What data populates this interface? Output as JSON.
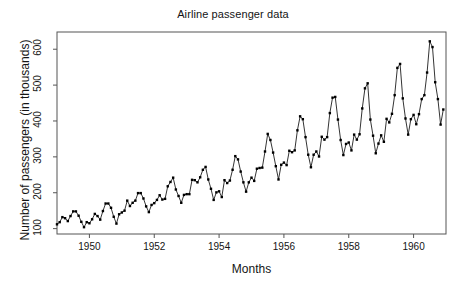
{
  "chart_data": {
    "type": "line",
    "title": "Airline passenger data",
    "xlabel": "Months",
    "ylabel": "Number of passengers (in thousands)",
    "xlim": [
      1949.0,
      1961.0
    ],
    "ylim": [
      85,
      648
    ],
    "grid": false,
    "legend": null,
    "marker": "filled-square",
    "line_color": "#000000",
    "marker_color": "#000000",
    "frame_color": "#555555",
    "background": "#ffffff",
    "xticks": [
      1950,
      1952,
      1954,
      1956,
      1958,
      1960
    ],
    "xtick_labels": [
      "1950",
      "1952",
      "1954",
      "1956",
      "1958",
      "1960"
    ],
    "yticks": [
      100,
      200,
      300,
      400,
      500,
      600
    ],
    "ytick_labels": [
      "100",
      "200",
      "300",
      "400",
      "500",
      "600"
    ],
    "x_start": 1949.0,
    "x_step": 0.0833333,
    "series": [
      {
        "name": "AirPassengers",
        "values": [
          112,
          118,
          132,
          129,
          121,
          135,
          148,
          148,
          136,
          119,
          104,
          118,
          115,
          126,
          141,
          135,
          125,
          149,
          170,
          170,
          158,
          133,
          114,
          140,
          145,
          150,
          178,
          163,
          172,
          178,
          199,
          199,
          184,
          162,
          146,
          166,
          171,
          180,
          193,
          181,
          183,
          218,
          230,
          242,
          209,
          191,
          172,
          194,
          196,
          196,
          236,
          235,
          229,
          243,
          264,
          272,
          237,
          211,
          180,
          201,
          204,
          188,
          235,
          227,
          234,
          264,
          302,
          293,
          259,
          229,
          203,
          229,
          242,
          233,
          267,
          269,
          270,
          315,
          364,
          347,
          312,
          274,
          237,
          278,
          284,
          277,
          317,
          313,
          318,
          374,
          413,
          405,
          355,
          306,
          271,
          306,
          315,
          301,
          356,
          348,
          355,
          422,
          465,
          467,
          404,
          347,
          305,
          336,
          340,
          318,
          362,
          348,
          363,
          435,
          491,
          505,
          404,
          359,
          310,
          337,
          360,
          342,
          406,
          396,
          420,
          472,
          548,
          559,
          463,
          407,
          362,
          405,
          417,
          391,
          419,
          461,
          472,
          535,
          622,
          606,
          508,
          461,
          390,
          432
        ]
      }
    ]
  }
}
